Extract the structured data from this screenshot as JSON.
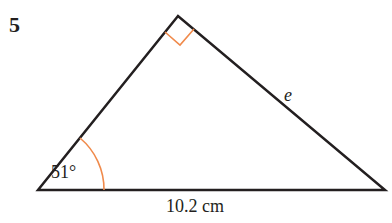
{
  "question": {
    "number": "5"
  },
  "diagram": {
    "type": "right-triangle",
    "vertices": {
      "top": [
        178,
        16
      ],
      "bottom_left": [
        38,
        190
      ],
      "bottom_right": [
        385,
        190
      ]
    },
    "labels": {
      "angle": "51°",
      "base": "10.2 cm",
      "side": "e"
    },
    "markers": {
      "right_angle_at": "top",
      "angle_arc_at": "bottom_left"
    },
    "colors": {
      "lines": "#231f20",
      "markers": "#f08a4b"
    }
  }
}
